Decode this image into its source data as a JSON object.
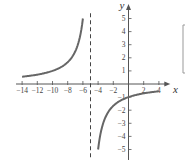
{
  "chart_data": {
    "type": "line",
    "title": "",
    "xlabel": "x",
    "ylabel": "y",
    "xlim": [
      -14.5,
      5
    ],
    "ylim": [
      -5.5,
      5.8
    ],
    "x_ticks": [
      -14,
      -12,
      -10,
      -8,
      -6,
      -4,
      -2,
      2,
      4
    ],
    "y_ticks": [
      -5,
      -4,
      -3,
      -2,
      -1,
      1,
      2,
      3,
      4,
      5
    ],
    "grid": false,
    "asymptote": {
      "type": "vertical",
      "x": -5,
      "style": "dashed"
    },
    "series": [
      {
        "name": "left branch",
        "x": [
          -14,
          -12,
          -10,
          -8,
          -7,
          -6
        ],
        "y": [
          0.56,
          0.71,
          1.0,
          1.67,
          2.5,
          5.0
        ]
      },
      {
        "name": "right branch",
        "x": [
          -4,
          -3,
          -2,
          -1,
          0,
          2,
          4
        ],
        "y": [
          -5.0,
          -2.5,
          -1.67,
          -1.25,
          -1.0,
          -0.71,
          -0.56
        ]
      }
    ],
    "function": "y = -5/(x+5)",
    "colors": {
      "curve": "#666666",
      "axes": "#555555"
    }
  },
  "labels": {
    "x_axis": "x",
    "y_axis": "y"
  }
}
